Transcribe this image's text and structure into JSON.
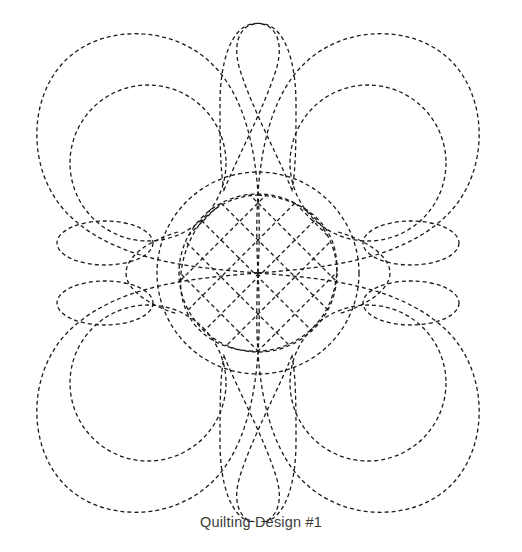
{
  "figure": {
    "caption": "Quilting Design #1",
    "title": "Quilting Design #1",
    "kind": "line-drawing",
    "background_color": "#ffffff",
    "stroke_color": "#1a1a1a",
    "stroke_width": 1.3,
    "dash_pattern": "4 3",
    "canvas": {
      "width": 522,
      "height": 522
    }
  },
  "geometry": {
    "center": {
      "x": 258,
      "y": 273
    },
    "outer_circle_radius": 101,
    "inner_circle_radius": 79,
    "lattice": {
      "spacing": 26,
      "angle_degrees": 45,
      "line_count_per_direction": 7
    },
    "background_circles": [
      {
        "cx": 148,
        "cy": 163,
        "r": 78
      },
      {
        "cx": 368,
        "cy": 163,
        "r": 78
      },
      {
        "cx": 148,
        "cy": 383,
        "r": 78
      },
      {
        "cx": 368,
        "cy": 383,
        "r": 78
      }
    ],
    "corner_petals": [
      {
        "name": "top-left",
        "tip": {
          "x": 258,
          "y": 273
        }
      },
      {
        "name": "top-right",
        "tip": {
          "x": 258,
          "y": 273
        }
      },
      {
        "name": "bottom-left",
        "tip": {
          "x": 258,
          "y": 273
        }
      },
      {
        "name": "bottom-right",
        "tip": {
          "x": 258,
          "y": 273
        }
      }
    ],
    "edge_teardrops_per_side": 2,
    "side_ellipses_per_side": 2,
    "side_ellipse_rx": 48,
    "side_ellipse_ry": 22
  }
}
